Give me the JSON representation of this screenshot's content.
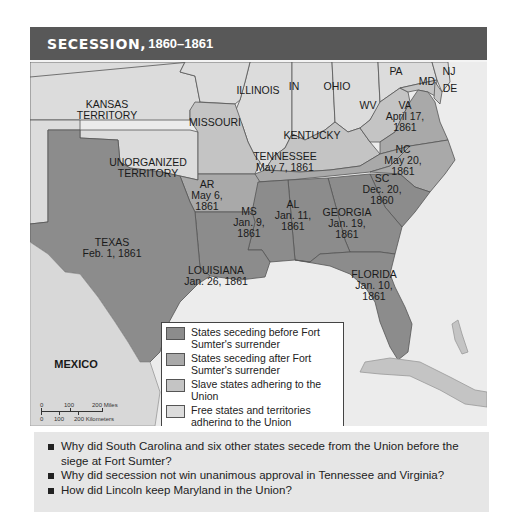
{
  "header": {
    "title_main": "SECESSION,",
    "title_years": "1860–1861"
  },
  "map": {
    "colors": {
      "seceding_before_sumter": "#8c8c8c",
      "seceding_after_sumter": "#a9a9a9",
      "slave_states_union": "#c4c4c4",
      "free_states_union": "#dcdcdc",
      "water": "#ececec",
      "header_bar": "#585858"
    },
    "labels": {
      "kansas": "KANSAS",
      "kansas2": "TERRITORY",
      "missouri": "MISSOURI",
      "illinois": "ILLINOIS",
      "indiana": "IN",
      "ohio": "OHIO",
      "pa": "PA",
      "nj": "NJ",
      "md": "MD",
      "de": "DE",
      "wv": "WV",
      "va": "VA",
      "va_date1": "April 17,",
      "va_date2": "1861",
      "kentucky": "KENTUCKY",
      "unorg1": "UNORGANIZED",
      "unorg2": "TERRITORY",
      "tennessee": "TENNESSEE",
      "tennessee_date": "May 7, 1861",
      "nc": "NC",
      "nc_date1": "May 20,",
      "nc_date2": "1861",
      "ar": "AR",
      "ar_date1": "May 6,",
      "ar_date2": "1861",
      "sc": "SC",
      "sc_date1": "Dec. 20,",
      "sc_date2": "1860",
      "ms": "MS",
      "ms_date1": "Jan. 9,",
      "ms_date2": "1861",
      "al": "AL",
      "al_date1": "Jan. 11,",
      "al_date2": "1861",
      "georgia": "GEORGIA",
      "georgia_date1": "Jan. 19,",
      "georgia_date2": "1861",
      "texas": "TEXAS",
      "texas_date": "Feb. 1, 1861",
      "louisiana": "LOUISIANA",
      "louisiana_date": "Jan. 26, 1861",
      "florida": "FLORIDA",
      "florida_date1": "Jan. 10,",
      "florida_date2": "1861",
      "mexico": "MEXICO"
    },
    "legend": [
      {
        "label": "States seceding before Fort Sumter's surrender"
      },
      {
        "label": "States seceding after Fort Sumter's surrender"
      },
      {
        "label": "Slave states adhering to the Union"
      },
      {
        "label": "Free states and territories adhering to the Union"
      }
    ],
    "scale": {
      "miles_ticks": [
        "0",
        "100",
        "200 Miles"
      ],
      "km_ticks": [
        "0",
        "100",
        "200 Kilometers"
      ]
    }
  },
  "questions": [
    "Why did South Carolina and six other states secede from the Union before the siege at Fort Sumter?",
    "Why did secession not win unanimous approval in Tennessee and Virginia?",
    "How did Lincoln keep Maryland in the Union?"
  ]
}
